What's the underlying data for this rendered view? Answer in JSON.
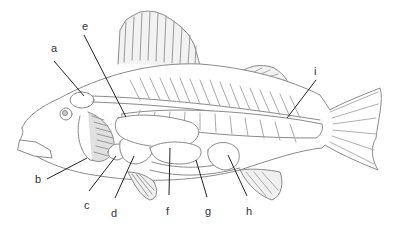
{
  "diagram": {
    "labels": [
      {
        "id": "a",
        "text": "a",
        "x": 51,
        "y": 43
      },
      {
        "id": "b",
        "text": "b",
        "x": 35,
        "y": 175
      },
      {
        "id": "c",
        "text": "c",
        "x": 85,
        "y": 202
      },
      {
        "id": "d",
        "text": "d",
        "x": 111,
        "y": 210
      },
      {
        "id": "e",
        "text": "e",
        "x": 82,
        "y": 22
      },
      {
        "id": "f",
        "text": "f",
        "x": 165,
        "y": 208
      },
      {
        "id": "g",
        "text": "g",
        "x": 205,
        "y": 208
      },
      {
        "id": "h",
        "text": "h",
        "x": 246,
        "y": 208
      },
      {
        "id": "i",
        "text": "i",
        "x": 313,
        "y": 67
      }
    ],
    "colors": {
      "outline": "#8a8a8a",
      "leader_line": "#222222",
      "fin_shade": "#b0b0b0"
    }
  }
}
